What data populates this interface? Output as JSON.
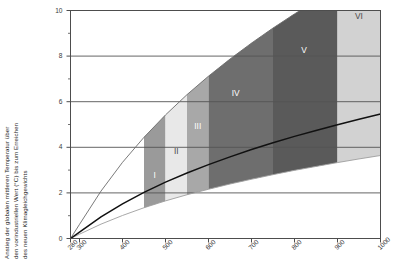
{
  "axes": {
    "y_label_lines": [
      "Anstieg der globalen mittleren Temperatur über",
      "den vorindustriellen Wert (°C) bis zum Erreichen",
      "des neuen Klimagleichgewichts"
    ],
    "y_ticks": [
      "0",
      "2",
      "4",
      "6",
      "8",
      "10"
    ],
    "x_ticks": [
      "280",
      "300",
      "400",
      "500",
      "600",
      "700",
      "800",
      "900",
      "1000"
    ]
  },
  "chart_data": {
    "type": "area",
    "title": "",
    "xlabel": "",
    "ylabel": "Anstieg der globalen mittleren Temperatur über den vorindustriellen Wert (°C) bis zum Erreichen des neuen Klimagleichgewichts",
    "xlim": [
      280,
      1000
    ],
    "ylim": [
      0,
      10
    ],
    "x_ticks": [
      280,
      300,
      400,
      500,
      600,
      700,
      800,
      900,
      1000
    ],
    "y_ticks": [
      0,
      2,
      4,
      6,
      8,
      10
    ],
    "y_minor_ticks": [
      1,
      3,
      5,
      7,
      9
    ],
    "grid": "horizontal-major",
    "legend": "none",
    "x": [
      280,
      300,
      350,
      400,
      450,
      500,
      550,
      600,
      650,
      700,
      750,
      800,
      850,
      900,
      950,
      1000
    ],
    "series": [
      {
        "name": "Obergrenze (hohe Klimasensitivität)",
        "values": [
          0,
          0.62,
          2.08,
          3.34,
          4.44,
          5.42,
          6.31,
          7.12,
          7.87,
          8.57,
          9.23,
          9.85,
          10.43,
          10.98,
          11.51,
          12.01
        ]
      },
      {
        "name": "Mittlerer Wert",
        "values": [
          0,
          0.28,
          0.95,
          1.52,
          2.02,
          2.47,
          2.87,
          3.24,
          3.58,
          3.9,
          4.2,
          4.48,
          4.74,
          4.99,
          5.23,
          5.46
        ]
      },
      {
        "name": "Untergrenze (niedrige Klimasensitivität)",
        "values": [
          0,
          0.19,
          0.63,
          1.01,
          1.35,
          1.65,
          1.92,
          2.16,
          2.39,
          2.6,
          2.8,
          2.99,
          3.16,
          3.33,
          3.49,
          3.64
        ]
      }
    ],
    "bands": [
      {
        "label": "I",
        "x_start": 450,
        "x_end": 500,
        "color": "#9a9a9a"
      },
      {
        "label": "II",
        "x_start": 500,
        "x_end": 550,
        "color": "#e8e8e8"
      },
      {
        "label": "III",
        "x_start": 550,
        "x_end": 600,
        "color": "#a8a8a8"
      },
      {
        "label": "IV",
        "x_start": 600,
        "x_end": 750,
        "color": "#6e6e6e"
      },
      {
        "label": "V",
        "x_start": 750,
        "x_end": 900,
        "color": "#5a5a5a"
      },
      {
        "label": "VI",
        "x_start": 900,
        "x_end": 1000,
        "color": "#d2d2d2"
      }
    ],
    "colors": {
      "frame": "#4d4d4d",
      "grid": "#555555",
      "center_curve": "#111111",
      "upper_curve": "#6b6b6b",
      "lower_curve": "#9e9e9e",
      "text": "#3a3a3a"
    }
  }
}
